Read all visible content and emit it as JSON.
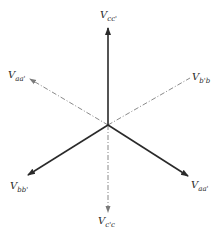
{
  "diagram": {
    "type": "phasor-diagram",
    "center": [
      108,
      125
    ],
    "colors": {
      "solid": "#2a2a2a",
      "dashed": "#8a8a8a"
    },
    "phasors": [
      {
        "id": "vcc",
        "main": "V",
        "sub": "cc'",
        "style": "solid",
        "tip": [
          108,
          28
        ],
        "label_pos": [
          100,
          10
        ],
        "arrow": true
      },
      {
        "id": "vaa_neg",
        "main": "V",
        "sub": "aa'",
        "style": "dashed",
        "tip": [
          30,
          79
        ],
        "label_pos": [
          8,
          70
        ],
        "arrow": true
      },
      {
        "id": "vbpb",
        "main": "V",
        "sub": "b'b",
        "style": "dashed",
        "tip": [
          190,
          78
        ],
        "label_pos": [
          192,
          72
        ],
        "arrow": false
      },
      {
        "id": "vbb",
        "main": "V",
        "sub": "bb'",
        "style": "solid",
        "tip": [
          28,
          175
        ],
        "label_pos": [
          10,
          181
        ],
        "arrow": true
      },
      {
        "id": "vaa",
        "main": "V",
        "sub": "aa'",
        "style": "solid",
        "tip": [
          188,
          176
        ],
        "label_pos": [
          191,
          180
        ],
        "arrow": true
      },
      {
        "id": "vcpc",
        "main": "V",
        "sub": "c'c",
        "style": "dashed",
        "tip": [
          108,
          212
        ],
        "label_pos": [
          98,
          216
        ],
        "arrow": true
      }
    ]
  }
}
